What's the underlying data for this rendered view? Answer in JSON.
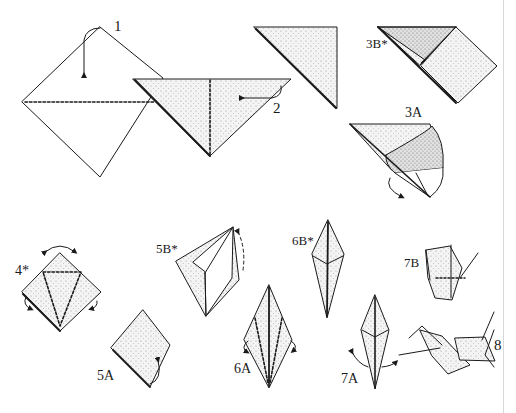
{
  "diagram": {
    "colors": {
      "line": "#1a1a1a",
      "paper": "#ffffff",
      "shade": "#e6e6e6",
      "stipple": "#8a8a8a",
      "page_edge": "#d8d8d8"
    },
    "steps": [
      {
        "id": "1",
        "label": "1",
        "description": "Square turned as diamond; fold top corner down to bottom along dotted diagonal"
      },
      {
        "id": "2",
        "label": "2",
        "description": "Triangle; fold in half along dotted vertical line"
      },
      {
        "id": "3",
        "label": "",
        "description": "Small folded triangle"
      },
      {
        "id": "3B",
        "label": "3B*",
        "description": "Squash fold result"
      },
      {
        "id": "3A",
        "label": "3A",
        "description": "Open pocket and squash"
      },
      {
        "id": "4",
        "label": "4*",
        "description": "Preliminary base with dotted kite folds"
      },
      {
        "id": "5A",
        "label": "5A",
        "description": "Sides folded in"
      },
      {
        "id": "5B",
        "label": "5B*",
        "description": "Petal fold lifting"
      },
      {
        "id": "6A",
        "label": "6A",
        "description": "Bird base; fold edges to center along dotted lines"
      },
      {
        "id": "6B",
        "label": "6B*",
        "description": "Narrowed bird base"
      },
      {
        "id": "7A",
        "label": "7A",
        "description": "Inside reverse fold legs up"
      },
      {
        "id": "7B",
        "label": "7B",
        "description": "Neck and tail raised, dotted wing fold"
      },
      {
        "id": "8",
        "label": "8",
        "description": "Finished crane"
      }
    ]
  }
}
